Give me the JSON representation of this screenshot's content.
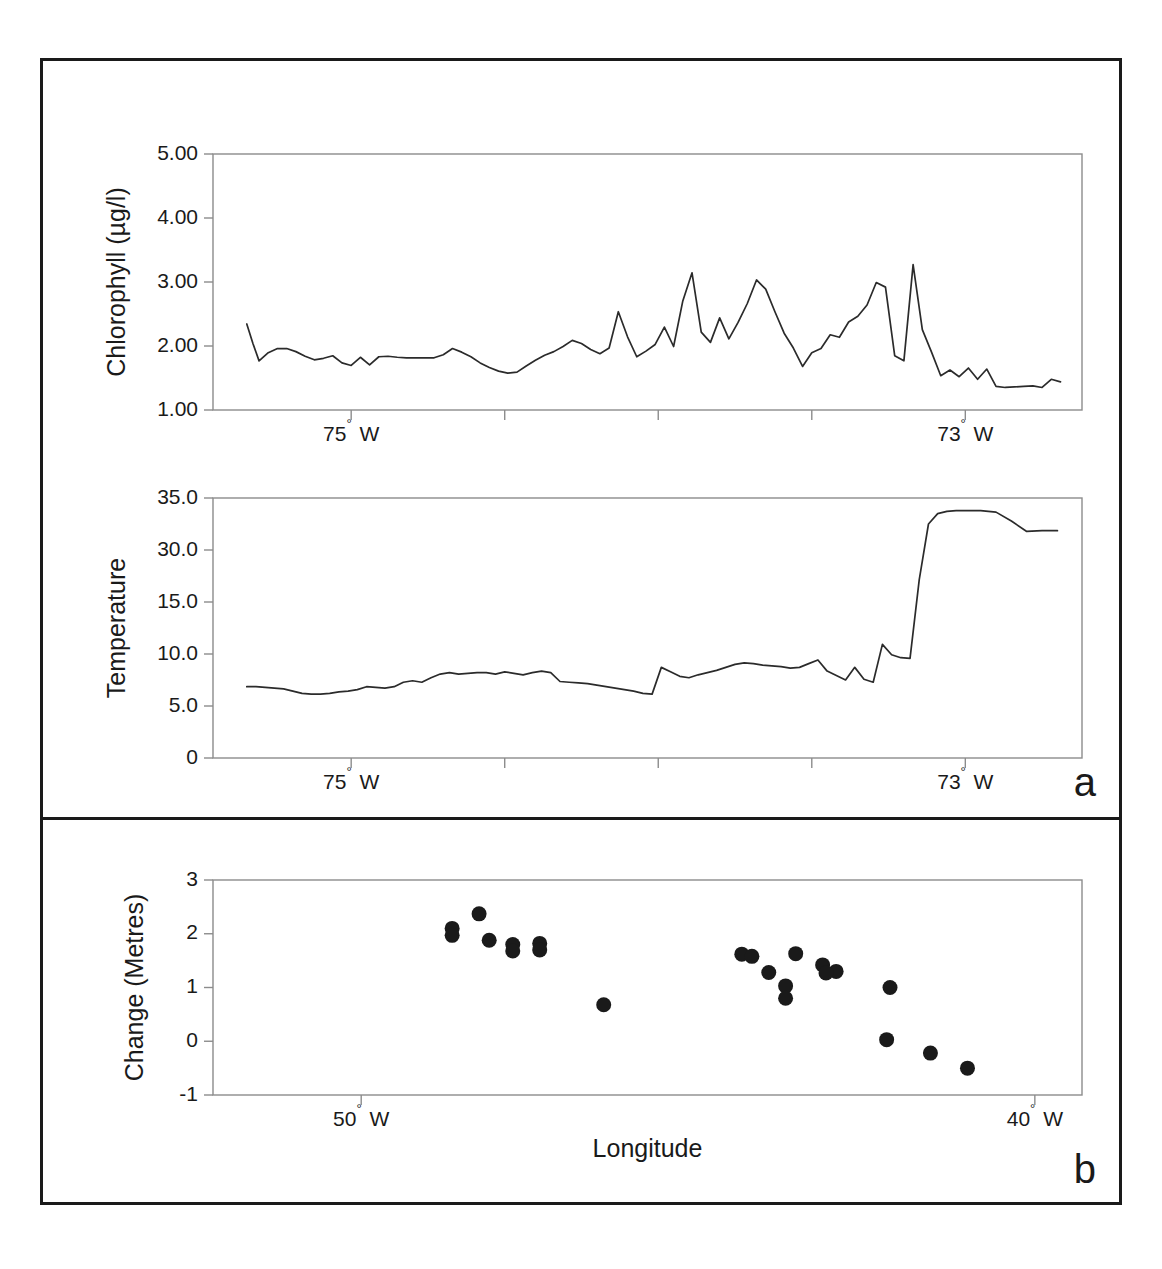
{
  "figure": {
    "panels": [
      {
        "letter": "a",
        "name": "panel-a"
      },
      {
        "letter": "b",
        "name": "panel-b"
      }
    ]
  },
  "chart_data": [
    {
      "type": "line",
      "name": "chlorophyll-vs-longitude",
      "title": "",
      "xlabel": "",
      "ylabel": "Chlorophyll (µg/l)",
      "ylim": [
        0,
        5.0
      ],
      "xlim": [
        -75.45,
        -72.62
      ],
      "grid": false,
      "legend": "none",
      "ytick_labels": [
        "5.00",
        "4.00",
        "3.00",
        "2.00",
        "1.00"
      ],
      "ytick_values": [
        5.0,
        4.0,
        3.0,
        2.0,
        1.0
      ],
      "xtick_labels": [
        "75° W",
        "",
        "",
        "",
        "73° W"
      ],
      "xtick_values": [
        -75.0,
        -74.5,
        -74.0,
        -73.5,
        -73.0
      ],
      "x": [
        -75.34,
        -75.32,
        -75.3,
        -75.27,
        -75.24,
        -75.21,
        -75.18,
        -75.15,
        -75.12,
        -75.09,
        -75.06,
        -75.03,
        -75.0,
        -74.97,
        -74.94,
        -74.91,
        -74.88,
        -74.85,
        -74.82,
        -74.79,
        -74.76,
        -74.73,
        -74.7,
        -74.67,
        -74.64,
        -74.61,
        -74.58,
        -74.55,
        -74.52,
        -74.49,
        -74.46,
        -74.43,
        -74.4,
        -74.37,
        -74.34,
        -74.31,
        -74.28,
        -74.25,
        -74.22,
        -74.19,
        -74.16,
        -74.13,
        -74.1,
        -74.07,
        -74.04,
        -74.01,
        -73.98,
        -73.95,
        -73.92,
        -73.89,
        -73.86,
        -73.83,
        -73.8,
        -73.77,
        -73.74,
        -73.71,
        -73.68,
        -73.65,
        -73.62,
        -73.59,
        -73.56,
        -73.53,
        -73.5,
        -73.47,
        -73.44,
        -73.41,
        -73.38,
        -73.35,
        -73.32,
        -73.29,
        -73.26,
        -73.23,
        -73.2,
        -73.17,
        -73.14,
        -73.11,
        -73.08,
        -73.05,
        -73.02,
        -72.99,
        -72.96,
        -72.93,
        -72.9,
        -72.87,
        -72.84,
        -72.81,
        -72.78,
        -72.75,
        -72.72,
        -72.69
      ],
      "y": [
        1.68,
        1.3,
        0.96,
        1.12,
        1.2,
        1.2,
        1.14,
        1.05,
        0.98,
        1.01,
        1.06,
        0.92,
        0.87,
        1.03,
        0.88,
        1.04,
        1.05,
        1.03,
        1.02,
        1.02,
        1.02,
        1.02,
        1.08,
        1.2,
        1.13,
        1.04,
        0.92,
        0.83,
        0.76,
        0.72,
        0.74,
        0.86,
        0.97,
        1.07,
        1.14,
        1.24,
        1.36,
        1.3,
        1.18,
        1.1,
        1.21,
        1.92,
        1.43,
        1.04,
        1.15,
        1.28,
        1.62,
        1.24,
        2.13,
        2.68,
        1.52,
        1.32,
        1.8,
        1.39,
        1.71,
        2.08,
        2.54,
        2.36,
        1.92,
        1.5,
        1.21,
        0.85,
        1.12,
        1.2,
        1.47,
        1.42,
        1.72,
        1.83,
        2.05,
        2.49,
        2.4,
        1.06,
        0.96,
        2.84,
        1.57,
        1.13,
        0.67,
        0.78,
        0.65,
        0.82,
        0.6,
        0.8,
        0.46,
        0.44,
        0.45,
        0.46,
        0.47,
        0.44,
        0.6,
        0.55
      ]
    },
    {
      "type": "line",
      "name": "temperature-vs-longitude",
      "title": "",
      "xlabel": "",
      "ylabel": "Temperature",
      "ylim": [
        0,
        35.0
      ],
      "xlim": [
        -75.45,
        -72.62
      ],
      "grid": false,
      "legend": "none",
      "ytick_labels": [
        "35.0",
        "30.0",
        "15.0",
        "10.0",
        "5.0",
        "0"
      ],
      "ytick_values": [
        35.0,
        30.0,
        15.0,
        10.0,
        5.0,
        0
      ],
      "xtick_labels": [
        "75° W",
        "",
        "",
        "",
        "73° W"
      ],
      "xtick_values": [
        -75.0,
        -74.5,
        -74.0,
        -73.5,
        -73.0
      ],
      "x": [
        -75.34,
        -75.31,
        -75.28,
        -75.25,
        -75.22,
        -75.19,
        -75.16,
        -75.13,
        -75.1,
        -75.07,
        -75.04,
        -75.01,
        -74.98,
        -74.95,
        -74.92,
        -74.89,
        -74.86,
        -74.83,
        -74.8,
        -74.77,
        -74.74,
        -74.71,
        -74.68,
        -74.65,
        -74.62,
        -74.59,
        -74.56,
        -74.53,
        -74.5,
        -74.47,
        -74.44,
        -74.41,
        -74.38,
        -74.35,
        -74.32,
        -74.29,
        -74.26,
        -74.23,
        -74.2,
        -74.17,
        -74.14,
        -74.11,
        -74.08,
        -74.05,
        -74.02,
        -73.99,
        -73.96,
        -73.93,
        -73.9,
        -73.87,
        -73.84,
        -73.81,
        -73.78,
        -73.75,
        -73.72,
        -73.69,
        -73.66,
        -73.63,
        -73.6,
        -73.57,
        -73.54,
        -73.51,
        -73.48,
        -73.45,
        -73.42,
        -73.39,
        -73.36,
        -73.33,
        -73.3,
        -73.27,
        -73.24,
        -73.21,
        -73.18,
        -73.15,
        -73.12,
        -73.09,
        -73.06,
        -73.03,
        -73.0,
        -72.95,
        -72.9,
        -72.85,
        -72.8,
        -72.75,
        -72.7
      ],
      "y": [
        9.6,
        9.6,
        9.5,
        9.4,
        9.3,
        9.0,
        8.7,
        8.6,
        8.6,
        8.7,
        8.9,
        9.0,
        9.2,
        9.6,
        9.5,
        9.4,
        9.6,
        10.2,
        10.4,
        10.2,
        10.8,
        11.3,
        11.5,
        11.3,
        11.4,
        11.5,
        11.5,
        11.3,
        11.6,
        11.4,
        11.2,
        11.5,
        11.7,
        11.5,
        10.3,
        10.2,
        10.1,
        10.0,
        9.8,
        9.6,
        9.4,
        9.2,
        9.0,
        8.7,
        8.6,
        12.2,
        11.6,
        11.0,
        10.8,
        11.2,
        11.5,
        11.8,
        12.2,
        12.6,
        12.8,
        12.7,
        12.5,
        12.4,
        12.3,
        12.1,
        12.2,
        12.7,
        13.2,
        11.7,
        11.1,
        10.5,
        12.2,
        10.6,
        10.2,
        15.3,
        13.9,
        13.5,
        13.4,
        24.0,
        31.5,
        32.9,
        33.2,
        33.3,
        33.3,
        33.3,
        33.1,
        31.9,
        30.5,
        30.6,
        30.6
      ]
    },
    {
      "type": "scatter",
      "name": "change-vs-longitude",
      "title": "",
      "xlabel": "Longitude",
      "ylabel": "Change (Metres)",
      "ylim": [
        -1,
        3
      ],
      "xlim": [
        -52.2,
        -39.3
      ],
      "grid": false,
      "legend": "none",
      "ytick_labels": [
        "3",
        "2",
        "1",
        "0",
        "-1"
      ],
      "ytick_values": [
        3,
        2,
        1,
        0,
        -1
      ],
      "xtick_labels": [
        "50° W",
        "40° W"
      ],
      "xtick_values": [
        -50.0,
        -40.0
      ],
      "points": [
        {
          "x": -48.65,
          "y": 2.1
        },
        {
          "x": -48.65,
          "y": 1.97
        },
        {
          "x": -48.25,
          "y": 2.37
        },
        {
          "x": -48.1,
          "y": 1.88
        },
        {
          "x": -47.75,
          "y": 1.8
        },
        {
          "x": -47.75,
          "y": 1.68
        },
        {
          "x": -47.35,
          "y": 1.82
        },
        {
          "x": -47.35,
          "y": 1.7
        },
        {
          "x": -46.4,
          "y": 0.68
        },
        {
          "x": -44.35,
          "y": 1.62
        },
        {
          "x": -44.2,
          "y": 1.58
        },
        {
          "x": -43.55,
          "y": 1.63
        },
        {
          "x": -43.95,
          "y": 1.28
        },
        {
          "x": -43.15,
          "y": 1.42
        },
        {
          "x": -42.95,
          "y": 1.3
        },
        {
          "x": -43.1,
          "y": 1.27
        },
        {
          "x": -43.7,
          "y": 1.03
        },
        {
          "x": -43.7,
          "y": 0.8
        },
        {
          "x": -42.15,
          "y": 1.0
        },
        {
          "x": -42.2,
          "y": 0.03
        },
        {
          "x": -41.55,
          "y": -0.22
        },
        {
          "x": -41.0,
          "y": -0.5
        }
      ]
    }
  ]
}
